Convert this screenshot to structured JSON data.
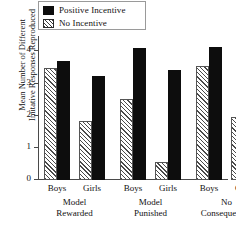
{
  "chart_data": {
    "type": "bar",
    "title": "",
    "xlabel": "",
    "ylabel": "Mean Number of Different Imitative Responses Reproduced",
    "ylabel_lines": [
      "Mean Number of Different",
      "Imitative Responses Reproduced"
    ],
    "ylim": [
      0,
      4.45
    ],
    "yticks": [
      0,
      1,
      2,
      3,
      4
    ],
    "ytick_labels": [
      "0",
      "1",
      "2",
      "3",
      "4"
    ],
    "grid": false,
    "legend_position": "top-left",
    "categories": [
      "Boys",
      "Girls",
      "Boys",
      "Girls",
      "Boys",
      "Girls"
    ],
    "group_labels": [
      {
        "line1": "Model",
        "line2": "Rewarded"
      },
      {
        "line1": "Model",
        "line2": "Punished"
      },
      {
        "line1": "No",
        "line2": "Consequences"
      }
    ],
    "series": [
      {
        "name": "No Incentive",
        "style": "hatched",
        "color": "#ffffff",
        "values": [
          3.48,
          1.85,
          2.53,
          0.55,
          3.55,
          1.95
        ]
      },
      {
        "name": "Positive Incentive",
        "style": "solid",
        "color": "#0d0d0d",
        "values": [
          3.69,
          3.25,
          4.1,
          3.42,
          4.15,
          3.15
        ]
      }
    ],
    "bars": [
      {
        "group": "Model Rewarded",
        "sex": "Boys",
        "series": "No Incentive",
        "value": 3.48
      },
      {
        "group": "Model Rewarded",
        "sex": "Boys",
        "series": "Positive Incentive",
        "value": 3.69
      },
      {
        "group": "Model Rewarded",
        "sex": "Girls",
        "series": "No Incentive",
        "value": 1.85
      },
      {
        "group": "Model Rewarded",
        "sex": "Girls",
        "series": "Positive Incentive",
        "value": 3.25
      },
      {
        "group": "Model Punished",
        "sex": "Boys",
        "series": "No Incentive",
        "value": 2.53
      },
      {
        "group": "Model Punished",
        "sex": "Boys",
        "series": "Positive Incentive",
        "value": 4.1
      },
      {
        "group": "Model Punished",
        "sex": "Girls",
        "series": "No Incentive",
        "value": 0.55
      },
      {
        "group": "Model Punished",
        "sex": "Girls",
        "series": "Positive Incentive",
        "value": 3.42
      },
      {
        "group": "No Consequences",
        "sex": "Boys",
        "series": "No Incentive",
        "value": 3.55
      },
      {
        "group": "No Consequences",
        "sex": "Boys",
        "series": "Positive Incentive",
        "value": 4.15
      },
      {
        "group": "No Consequences",
        "sex": "Girls",
        "series": "No Incentive",
        "value": 1.95
      },
      {
        "group": "No Consequences",
        "sex": "Girls",
        "series": "Positive Incentive",
        "value": 3.15
      }
    ]
  },
  "legend": {
    "items": [
      {
        "label": "Positive Incentive",
        "style": "solid"
      },
      {
        "label": "No Incentive",
        "style": "hatch"
      }
    ]
  }
}
